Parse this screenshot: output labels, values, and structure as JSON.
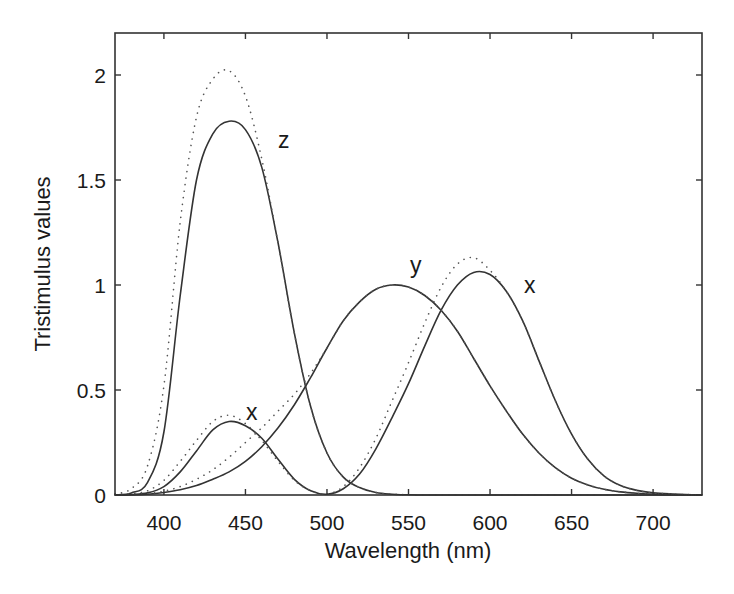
{
  "chart_data": {
    "type": "line",
    "title": "",
    "xlabel": "Wavelength (nm)",
    "ylabel": "Tristimulus values",
    "xlim": [
      370,
      730
    ],
    "ylim": [
      0,
      2.2
    ],
    "xticks": [
      400,
      450,
      500,
      550,
      600,
      650,
      700
    ],
    "yticks": [
      0,
      0.5,
      1,
      1.5,
      2
    ],
    "ytick_labels": [
      "0",
      "0.5",
      "1",
      "1.5",
      "2"
    ],
    "grid": false,
    "legend": "none (curves labeled inline)",
    "x": [
      370,
      380,
      390,
      400,
      410,
      420,
      430,
      440,
      450,
      460,
      470,
      480,
      490,
      500,
      510,
      520,
      530,
      540,
      550,
      560,
      570,
      580,
      590,
      600,
      610,
      620,
      630,
      640,
      650,
      660,
      670,
      680,
      690,
      700,
      710,
      720,
      730
    ],
    "series": [
      {
        "name": "x (solid)",
        "style": "solid",
        "values": [
          0.0,
          0.002,
          0.01,
          0.04,
          0.11,
          0.21,
          0.31,
          0.35,
          0.33,
          0.27,
          0.17,
          0.075,
          0.02,
          0.004,
          0.03,
          0.1,
          0.22,
          0.37,
          0.53,
          0.71,
          0.88,
          1.0,
          1.06,
          1.05,
          0.97,
          0.83,
          0.64,
          0.45,
          0.29,
          0.17,
          0.09,
          0.045,
          0.022,
          0.01,
          0.005,
          0.002,
          0.001
        ]
      },
      {
        "name": "y (solid)",
        "style": "solid",
        "values": [
          0.0,
          0.001,
          0.004,
          0.012,
          0.025,
          0.045,
          0.075,
          0.11,
          0.16,
          0.23,
          0.32,
          0.43,
          0.56,
          0.7,
          0.83,
          0.92,
          0.98,
          1.0,
          0.99,
          0.95,
          0.88,
          0.78,
          0.65,
          0.52,
          0.4,
          0.29,
          0.2,
          0.13,
          0.08,
          0.048,
          0.027,
          0.015,
          0.008,
          0.004,
          0.002,
          0.001,
          0.0
        ]
      },
      {
        "name": "z (solid)",
        "style": "solid",
        "values": [
          0.0,
          0.01,
          0.06,
          0.3,
          0.95,
          1.5,
          1.72,
          1.78,
          1.74,
          1.56,
          1.2,
          0.77,
          0.42,
          0.2,
          0.085,
          0.035,
          0.012,
          0.004,
          0.001,
          0.0,
          0.0,
          0.0,
          0.0,
          0.0,
          0.0,
          0.0,
          0.0,
          0.0,
          0.0,
          0.0,
          0.0,
          0.0,
          0.0,
          0.0,
          0.0,
          0.0,
          0.0
        ]
      },
      {
        "name": "x (dotted)",
        "style": "dotted",
        "values": [
          0.002,
          0.006,
          0.02,
          0.07,
          0.16,
          0.26,
          0.35,
          0.38,
          0.34,
          0.26,
          0.16,
          0.07,
          0.02,
          0.005,
          0.04,
          0.13,
          0.27,
          0.45,
          0.63,
          0.82,
          0.99,
          1.1,
          1.13,
          1.07,
          0.97,
          0.83,
          0.64,
          0.45,
          0.29,
          0.17,
          0.09,
          0.045,
          0.022,
          0.01,
          0.005,
          0.002,
          0.001
        ]
      },
      {
        "name": "y (dotted)",
        "style": "dotted",
        "values": [
          0.001,
          0.002,
          0.006,
          0.018,
          0.04,
          0.075,
          0.12,
          0.18,
          0.25,
          0.32,
          0.4,
          0.48,
          0.58,
          0.7,
          0.83,
          0.92,
          0.98,
          1.0,
          0.99,
          0.95,
          0.88,
          0.78,
          0.65,
          0.52,
          0.4,
          0.29,
          0.2,
          0.13,
          0.08,
          0.048,
          0.027,
          0.015,
          0.008,
          0.004,
          0.002,
          0.001,
          0.0
        ]
      },
      {
        "name": "z (dotted)",
        "style": "dotted",
        "values": [
          0.005,
          0.03,
          0.14,
          0.52,
          1.3,
          1.8,
          1.98,
          2.02,
          1.9,
          1.6,
          1.2,
          0.77,
          0.42,
          0.2,
          0.085,
          0.035,
          0.012,
          0.004,
          0.001,
          0.0,
          0.0,
          0.0,
          0.0,
          0.0,
          0.0,
          0.0,
          0.0,
          0.0,
          0.0,
          0.0,
          0.0,
          0.0,
          0.0,
          0.0,
          0.0,
          0.0,
          0.0
        ]
      }
    ],
    "annotations": [
      {
        "text": "z",
        "x": 471,
        "y": 1.67
      },
      {
        "text": "x",
        "x": 454,
        "y": 0.38
      },
      {
        "text": "y",
        "x": 555,
        "y": 1.06
      },
      {
        "text": "x",
        "x": 626,
        "y": 0.98
      }
    ]
  },
  "axes": {
    "xlabel": "Wavelength (nm)",
    "ylabel": "Tristimulus values",
    "xtick_labels": [
      "400",
      "450",
      "500",
      "550",
      "600",
      "650",
      "700"
    ],
    "ytick_labels": [
      "0",
      "0.5",
      "1",
      "1.5",
      "2"
    ]
  },
  "labels": {
    "z": "z",
    "x_small": "x",
    "y": "y",
    "x_large": "x"
  }
}
